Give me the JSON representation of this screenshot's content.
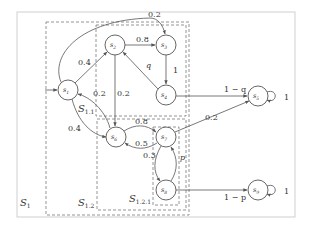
{
  "diagram": {
    "type": "Markov chain state diagram with nested dashed subsets",
    "boxes": [
      {
        "id": "S1",
        "label": "S",
        "sub": "1"
      },
      {
        "id": "S1.1",
        "label": "S",
        "sub": "1.1"
      },
      {
        "id": "S1.2",
        "label": "S",
        "sub": "1.2"
      },
      {
        "id": "S1.2.1",
        "label": "S",
        "sub": "1.2.1"
      }
    ],
    "nodes": [
      {
        "id": "s1",
        "label": "s",
        "sub": "1"
      },
      {
        "id": "s2",
        "label": "s",
        "sub": "2"
      },
      {
        "id": "s3",
        "label": "s",
        "sub": "3"
      },
      {
        "id": "s4",
        "label": "s",
        "sub": "4"
      },
      {
        "id": "s5",
        "label": "s",
        "sub": "5"
      },
      {
        "id": "s6",
        "label": "s",
        "sub": "6"
      },
      {
        "id": "s7",
        "label": "s",
        "sub": "7"
      },
      {
        "id": "s8",
        "label": "s",
        "sub": "8"
      },
      {
        "id": "s9",
        "label": "s",
        "sub": "9"
      }
    ],
    "edges": [
      {
        "from": "start",
        "to": "s1",
        "label": ""
      },
      {
        "from": "s1",
        "to": "s3",
        "label": "0.2"
      },
      {
        "from": "s1",
        "to": "s2",
        "label": "0.4"
      },
      {
        "from": "s1",
        "to": "s6",
        "label": "0.4"
      },
      {
        "from": "s6",
        "to": "s1",
        "label": "0.2"
      },
      {
        "from": "s2",
        "to": "s3",
        "label": "0.8"
      },
      {
        "from": "s2",
        "to": "s6",
        "label": "0.2"
      },
      {
        "from": "s4",
        "to": "s2",
        "label": "q"
      },
      {
        "from": "s3",
        "to": "s4",
        "label": "1"
      },
      {
        "from": "s4",
        "to": "s5",
        "label": "1 − q"
      },
      {
        "from": "s5",
        "to": "s5",
        "label": "1"
      },
      {
        "from": "s6",
        "to": "s7",
        "label": "0.8"
      },
      {
        "from": "s7",
        "to": "s6",
        "label": "0.5"
      },
      {
        "from": "s7",
        "to": "s5",
        "label": "0.2"
      },
      {
        "from": "s7",
        "to": "s8",
        "label": "0.3"
      },
      {
        "from": "s8",
        "to": "s7",
        "label": "p"
      },
      {
        "from": "s8",
        "to": "s9",
        "label": "1 − p"
      },
      {
        "from": "s9",
        "to": "s9",
        "label": "1"
      }
    ]
  }
}
